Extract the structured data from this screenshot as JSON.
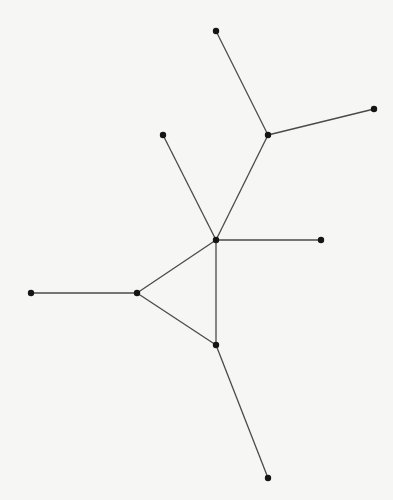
{
  "diagram": {
    "type": "graph",
    "directed": false,
    "colors": {
      "background": "#f6f6f5",
      "edge": "#4a4a4a",
      "node": "#151515"
    },
    "nodes": [
      {
        "id": "top",
        "x": 216,
        "y": 31
      },
      {
        "id": "upper-right",
        "x": 374,
        "y": 109
      },
      {
        "id": "branch",
        "x": 268,
        "y": 135
      },
      {
        "id": "upper-left",
        "x": 163,
        "y": 135
      },
      {
        "id": "hub",
        "x": 216,
        "y": 240
      },
      {
        "id": "hub-right",
        "x": 321,
        "y": 240
      },
      {
        "id": "far-left",
        "x": 31,
        "y": 293
      },
      {
        "id": "tri-left",
        "x": 137,
        "y": 293
      },
      {
        "id": "tri-bottom",
        "x": 216,
        "y": 345
      },
      {
        "id": "bottom",
        "x": 268,
        "y": 478
      }
    ],
    "edges": [
      [
        "top",
        "branch"
      ],
      [
        "upper-right",
        "branch"
      ],
      [
        "branch",
        "hub"
      ],
      [
        "upper-left",
        "hub"
      ],
      [
        "hub",
        "hub-right"
      ],
      [
        "hub",
        "tri-left"
      ],
      [
        "hub",
        "tri-bottom"
      ],
      [
        "tri-left",
        "tri-bottom"
      ],
      [
        "far-left",
        "tri-left"
      ],
      [
        "tri-bottom",
        "bottom"
      ]
    ]
  }
}
